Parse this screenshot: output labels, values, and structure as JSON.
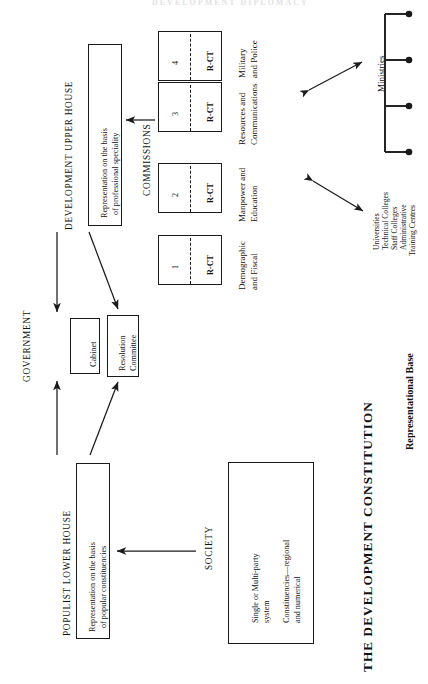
{
  "figure": {
    "title": "THE DEVELOPMENT CONSTITUTION",
    "top_partial_text": "DEVELOPMENT DIPLOMACY",
    "orientation": "rotated-90-ccw",
    "ink_color": "#1a1a1a",
    "paper_color": "#ffffff"
  },
  "sections": {
    "government_label": "GOVERNMENT",
    "society_label": "SOCIETY",
    "commissions_label": "COMMISSIONS",
    "upper_house_label": "DEVELOPMENT UPPER HOUSE",
    "lower_house_label": "POPULIST LOWER HOUSE",
    "representational_base_label": "Representational Base",
    "ministries_label": "Ministries"
  },
  "boxes": {
    "upper_house": {
      "line1": "Representation on the basis",
      "line2": "of professional speciality"
    },
    "lower_house": {
      "line1": "Representation on the basis",
      "line2": "of popular constituencies"
    },
    "cabinet": {
      "line1": "Cabinet"
    },
    "resolution_committee": {
      "line1": "Resolution",
      "line2": "Committee"
    },
    "society": {
      "line1": "Single or Multi-party",
      "line2": "system",
      "line3": "Constituencies—regional",
      "line4": "and numerical"
    }
  },
  "commissions": [
    {
      "number": "4",
      "code": "R-CT",
      "line1": "Military",
      "line2": "and Police"
    },
    {
      "number": "3",
      "code": "R-CT",
      "line1": "Resources and",
      "line2": "Communications"
    },
    {
      "number": "2",
      "code": "R-CT",
      "line1": "Manpower and",
      "line2": "Education"
    },
    {
      "number": "1",
      "code": "R-CT",
      "line1": "Demographic",
      "line2": "and Fiscal"
    }
  ],
  "training_institutions": [
    "Universities",
    "Technical Colleges",
    "Staff Colleges",
    "Administrative",
    "Training Centres"
  ],
  "ministries_branches": 4
}
